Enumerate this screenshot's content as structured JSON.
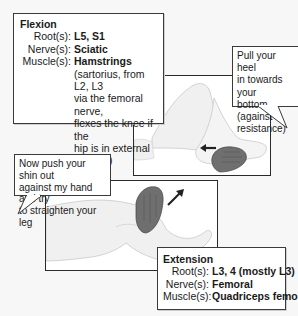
{
  "flexion": {
    "title": "Flexion",
    "root_label": "Root(s):",
    "root_value": "L5, S1",
    "nerve_label": "Nerve(s):",
    "nerve_value": "Sciatic",
    "muscle_label": "Muscle(s):",
    "muscle_value": "Hamstrings",
    "note_lines": [
      "(sartorius, from L2, L3",
      "via the femoral nerve,",
      "flexes the knee if the",
      "hip is in external rotation)"
    ]
  },
  "flexion_instruction": {
    "lines": [
      "Pull your heel",
      "in towards your",
      "bottom (against",
      "resistance)"
    ]
  },
  "extension_instruction": {
    "lines": [
      "Now push your shin out",
      "against my hand and try",
      "to straighten your leg"
    ]
  },
  "extension": {
    "title": "Extension",
    "root_label": "Root(s):",
    "root_value": "L3, 4 (mostly L3)",
    "nerve_label": "Nerve(s):",
    "nerve_value": "Femoral",
    "muscle_label": "Muscle(s):",
    "muscle_value": "Quadriceps femoris"
  },
  "colors": {
    "border": "#2a2a2a",
    "leg_fill": "#f0f0f0",
    "hand_fill": "#6f6f6f",
    "arrow": "#222222"
  }
}
